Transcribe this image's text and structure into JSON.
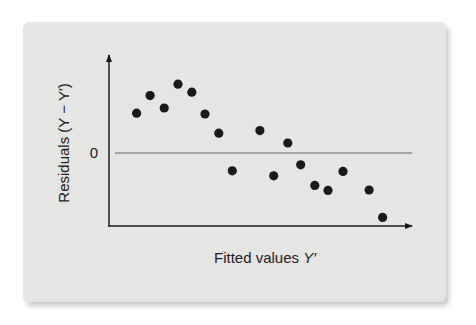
{
  "chart_data": {
    "type": "scatter",
    "title": "",
    "xlabel": "Fitted values Y′",
    "xlabel_parts": {
      "text": "Fitted values ",
      "var": "Y′"
    },
    "ylabel": "Residuals (Y − Y′)",
    "ytick_labels": [
      "0"
    ],
    "reference_line": {
      "y": 0,
      "label": "0"
    },
    "xlim": [
      0,
      10.1
    ],
    "ylim": [
      -3.6,
      4.9
    ],
    "grid": false,
    "legend": null,
    "points": [
      {
        "x": 0.92,
        "y": 1.99
      },
      {
        "x": 1.37,
        "y": 2.87
      },
      {
        "x": 1.84,
        "y": 2.25
      },
      {
        "x": 2.3,
        "y": 3.44
      },
      {
        "x": 2.76,
        "y": 3.04
      },
      {
        "x": 3.2,
        "y": 1.95
      },
      {
        "x": 3.66,
        "y": 0.99
      },
      {
        "x": 4.11,
        "y": -0.89
      },
      {
        "x": 5.03,
        "y": 1.12
      },
      {
        "x": 5.49,
        "y": -1.14
      },
      {
        "x": 5.96,
        "y": 0.5
      },
      {
        "x": 6.39,
        "y": -0.59
      },
      {
        "x": 6.86,
        "y": -1.62
      },
      {
        "x": 7.3,
        "y": -1.87
      },
      {
        "x": 7.8,
        "y": -0.92
      },
      {
        "x": 8.67,
        "y": -1.85
      },
      {
        "x": 9.12,
        "y": -3.22
      }
    ],
    "colors": {
      "panel": "#e5e5e4",
      "points": "#1a1a1a",
      "axis": "#1a1a1a",
      "zero_line": "#8c8c8c"
    }
  }
}
